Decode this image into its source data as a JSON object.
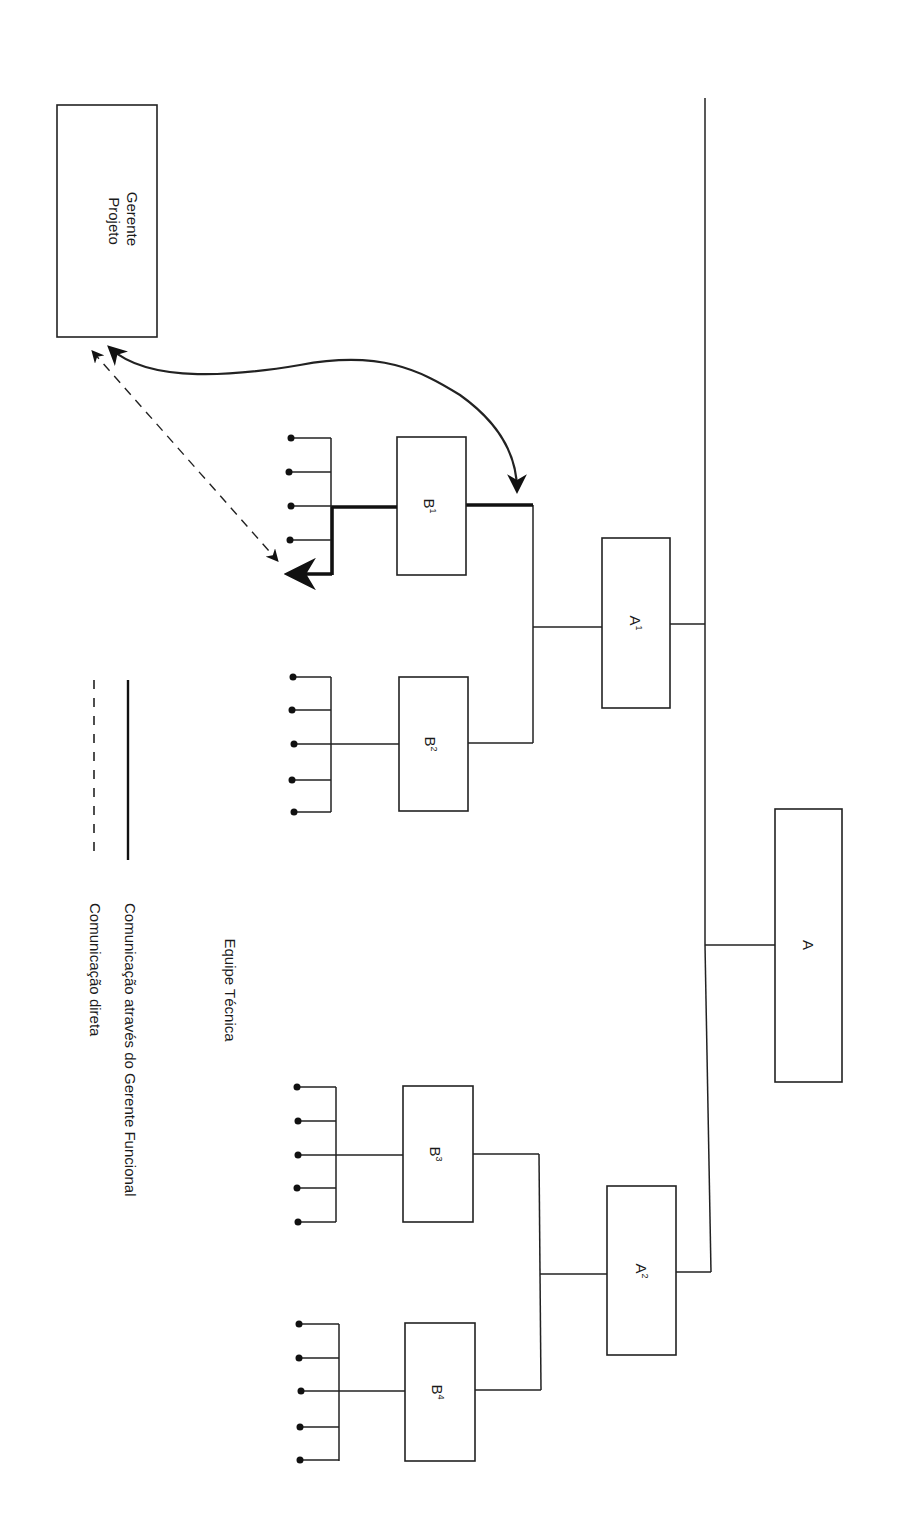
{
  "diagram": {
    "orientation": "rotated 90 degrees clockwise (text reads top-to-bottom)",
    "nodes": {
      "gerente_projeto": {
        "line1": "Gerente",
        "line2": "Projeto"
      },
      "a": {
        "label": "A"
      },
      "a1": {
        "base": "A",
        "sup": "1"
      },
      "a2": {
        "base": "A",
        "sup": "2"
      },
      "b1": {
        "base": "B",
        "sup": "1"
      },
      "b2": {
        "base": "B",
        "sup": "2"
      },
      "b3": {
        "base": "B",
        "sup": "3"
      },
      "b4": {
        "base": "B",
        "sup": "4"
      }
    },
    "team_label": "Equipe Técnica",
    "team_members_per_group": 5,
    "legend": {
      "solid": "Comunicação através do Gerente Funcional",
      "dashed": "Comunicação direta"
    },
    "colors": {
      "ink": "#222222",
      "paper": "#ffffff"
    }
  }
}
